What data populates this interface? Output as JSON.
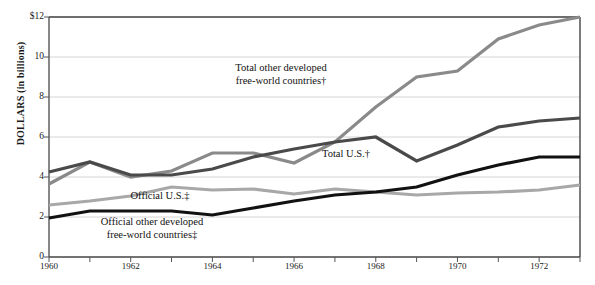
{
  "chart_data": {
    "type": "line",
    "title": "",
    "xlabel": "",
    "ylabel": "DOLLARS (in billions)",
    "x": [
      1960,
      1961,
      1962,
      1963,
      1964,
      1965,
      1966,
      1967,
      1968,
      1969,
      1970,
      1971,
      1972,
      1973
    ],
    "xlim": [
      1960,
      1973
    ],
    "ylim": [
      0,
      12
    ],
    "yticks": [
      0,
      2,
      4,
      6,
      8,
      10,
      12
    ],
    "ytick_labels": [
      "0",
      "2",
      "4",
      "6",
      "8",
      "10",
      "$12"
    ],
    "xticks": [
      1960,
      1961,
      1962,
      1963,
      1964,
      1965,
      1966,
      1967,
      1968,
      1969,
      1970,
      1971,
      1972,
      1973
    ],
    "xtick_labels_shown": [
      "1960",
      "1962",
      "1964",
      "1966",
      "1968",
      "1970",
      "1972"
    ],
    "xtick_label_values": [
      1960,
      1962,
      1964,
      1966,
      1968,
      1970,
      1972
    ],
    "grid": "horizontal",
    "legend": "inline-annotations",
    "series": [
      {
        "name": "Total other developed free-world countries†",
        "color": "#8a8a8a",
        "width": 3.2,
        "values": [
          3.65,
          4.75,
          4.0,
          4.3,
          5.2,
          5.2,
          4.7,
          5.75,
          7.5,
          9.0,
          9.3,
          10.9,
          11.6,
          12.0
        ]
      },
      {
        "name": "Total U.S.†",
        "color": "#4a4a4a",
        "width": 3.2,
        "values": [
          4.25,
          4.75,
          4.1,
          4.1,
          4.4,
          5.0,
          5.4,
          5.75,
          6.0,
          4.8,
          5.6,
          6.5,
          6.8,
          6.95
        ]
      },
      {
        "name": "Official U.S.‡",
        "color": "#a8a8a8",
        "width": 3.2,
        "values": [
          2.6,
          2.8,
          3.05,
          3.5,
          3.35,
          3.4,
          3.15,
          3.4,
          3.25,
          3.1,
          3.2,
          3.25,
          3.35,
          3.6
        ]
      },
      {
        "name": "Official other developed free-world countries‡",
        "color": "#111111",
        "width": 3.2,
        "values": [
          1.95,
          2.3,
          2.3,
          2.3,
          2.1,
          2.45,
          2.8,
          3.1,
          3.25,
          3.5,
          4.1,
          4.6,
          5.0,
          5.0
        ]
      }
    ],
    "annotations": [
      {
        "id": "annot-total-other",
        "lines": [
          "Total other developed",
          "free-world countries†"
        ],
        "x": 281,
        "y": 62
      },
      {
        "id": "annot-total-us",
        "lines": [
          "Total U.S.†"
        ],
        "x": 346,
        "y": 148
      },
      {
        "id": "annot-official-us",
        "lines": [
          "Official U.S.‡"
        ],
        "x": 160,
        "y": 190
      },
      {
        "id": "annot-official-other",
        "lines": [
          "Official other developed",
          "free-world countries‡"
        ],
        "x": 152,
        "y": 216
      }
    ]
  }
}
